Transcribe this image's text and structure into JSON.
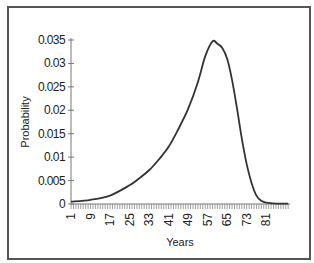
{
  "chart_data": {
    "type": "line",
    "title": "",
    "xlabel": "Years",
    "ylabel": "Probability",
    "x_tick_labels": [
      "1",
      "9",
      "17",
      "25",
      "33",
      "41",
      "49",
      "57",
      "65",
      "73",
      "81"
    ],
    "y_tick_labels": [
      "0",
      "0.005",
      "0.01",
      "0.015",
      "0.02",
      "0.025",
      "0.03",
      "0.035"
    ],
    "ylim": [
      0,
      0.035
    ],
    "xlim": [
      1,
      90
    ],
    "grid": false,
    "legend": null,
    "series": [
      {
        "name": "Probability",
        "color": "#333333",
        "x": [
          1,
          9,
          17,
          25,
          29,
          33,
          37,
          41,
          45,
          49,
          53,
          56,
          59,
          61,
          63,
          65,
          67,
          69,
          71,
          73,
          75,
          77,
          79,
          81,
          85,
          90
        ],
        "values": [
          0.0005,
          0.0009,
          0.0018,
          0.004,
          0.0055,
          0.0072,
          0.0095,
          0.0122,
          0.016,
          0.0203,
          0.026,
          0.0315,
          0.0347,
          0.0342,
          0.0333,
          0.031,
          0.0265,
          0.0205,
          0.014,
          0.0085,
          0.0045,
          0.0018,
          0.0007,
          0.0003,
          0.0001,
          0.0001
        ]
      }
    ]
  },
  "labels": {
    "xlabel": "Years",
    "ylabel": "Probability"
  }
}
